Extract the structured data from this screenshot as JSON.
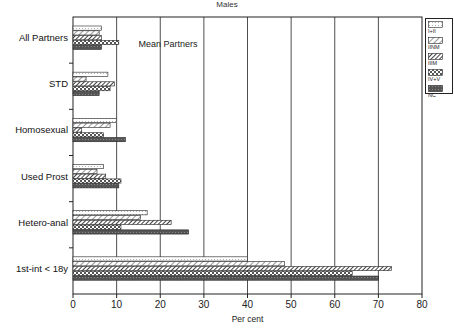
{
  "chart_data": {
    "type": "bar",
    "orientation": "horizontal",
    "title": "Males",
    "xlabel": "Per cent",
    "ylabel": "",
    "xlim": [
      0,
      80
    ],
    "x_ticks": [
      0,
      10,
      20,
      30,
      40,
      50,
      60,
      70,
      80
    ],
    "grid": "vertical",
    "legend_position": "right-top",
    "annotation": "Mean Partners",
    "categories": [
      "All Partners",
      "STD",
      "Homosexual",
      "Used Prost",
      "Hetero-anal",
      "1st-int < 18y"
    ],
    "series": [
      {
        "name": "I+II",
        "pattern": "dots-light",
        "values": [
          6.5,
          8,
          10,
          7,
          17,
          40
        ]
      },
      {
        "name": "IINM",
        "pattern": "hatch-light",
        "values": [
          6,
          3,
          8.5,
          5.5,
          15.5,
          48.5
        ]
      },
      {
        "name": "IIIM",
        "pattern": "hatch-dark",
        "values": [
          6.5,
          9.5,
          2,
          7.5,
          22.5,
          73
        ]
      },
      {
        "name": "IV+V",
        "pattern": "checker",
        "values": [
          10.5,
          8.5,
          7,
          11,
          11,
          64
        ]
      },
      {
        "name": "NC",
        "pattern": "dark-fill",
        "values": [
          6.5,
          6,
          12,
          10.5,
          26.5,
          70
        ]
      }
    ]
  },
  "colors": {
    "axis": "#222222",
    "grid": "#222222",
    "dark_fill": "#555555"
  }
}
